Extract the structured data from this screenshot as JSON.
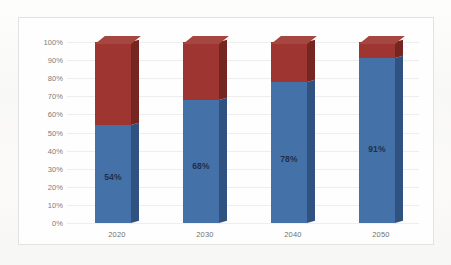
{
  "chart_data": {
    "type": "bar",
    "subtype": "100% stacked column, 3-D",
    "title": "",
    "xlabel": "",
    "ylabel": "",
    "ylim": [
      0,
      100
    ],
    "grid": true,
    "legend": "none",
    "categories": [
      "2020",
      "2030",
      "2040",
      "2050"
    ],
    "ytick_labels": [
      "100%",
      "90%",
      "80%",
      "70%",
      "60%",
      "50%",
      "40%",
      "30%",
      "20%",
      "10%",
      "0%"
    ],
    "ytick_values": [
      100,
      90,
      80,
      70,
      60,
      50,
      40,
      30,
      20,
      10,
      0
    ],
    "series": [
      {
        "name": "blue-series",
        "color": "#4472a8",
        "values": [
          54,
          68,
          78,
          91
        ],
        "data_labels": [
          "54%",
          "68%",
          "78%",
          "91%"
        ]
      },
      {
        "name": "red-series",
        "color": "#9e3530",
        "values": [
          46,
          32,
          22,
          9
        ],
        "data_labels": [
          "",
          "",
          "",
          ""
        ]
      }
    ]
  },
  "colors": {
    "blue_front": "#4472a8",
    "blue_side": "#2f5280",
    "red_front": "#9e3530",
    "red_side": "#762621",
    "red_top": "#a54740",
    "plot_background": "#fefefe",
    "page_background": "#fbfbfa",
    "gridline": "#efeeed",
    "axis_text": "#7c7c7c",
    "data_label_text": "#20304a",
    "frame_border": "#e2e2e2"
  }
}
